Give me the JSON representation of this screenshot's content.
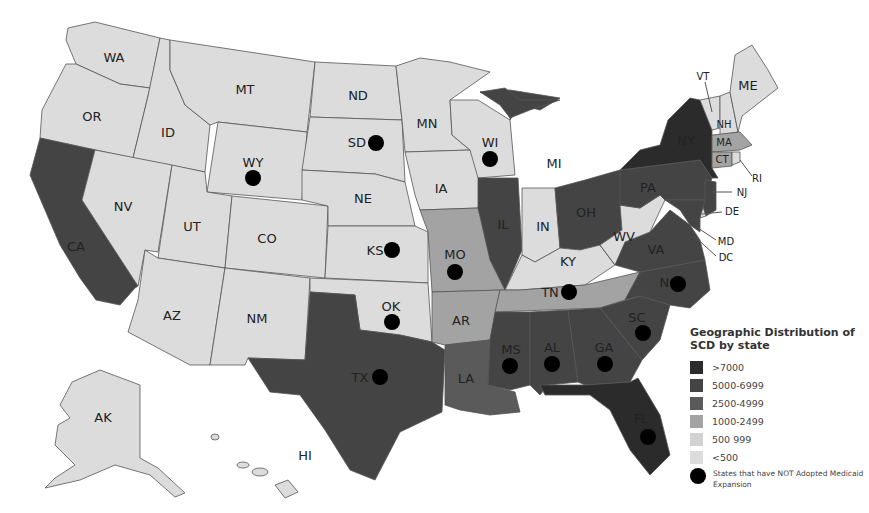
{
  "legend": {
    "title": "Geographic Distribution of SCD by state",
    "bins": [
      {
        "label": ">7000",
        "color": "#2b2b2b"
      },
      {
        "label": "5000-6999",
        "color": "#444444"
      },
      {
        "label": "2500-4999",
        "color": "#5a5a5a"
      },
      {
        "label": "1000-2499",
        "color": "#a3a3a3"
      },
      {
        "label": "500 999",
        "color": "#d2d2d2"
      },
      {
        "label": "<500",
        "color": "#dcdcdc"
      }
    ],
    "marker_label": "States that have NOT Adopted Medicaid Expansion"
  },
  "states": [
    {
      "id": "WA",
      "bin": 5,
      "dot": false
    },
    {
      "id": "OR",
      "bin": 5,
      "dot": false
    },
    {
      "id": "CA",
      "bin": 1,
      "dot": false
    },
    {
      "id": "ID",
      "bin": 5,
      "dot": false
    },
    {
      "id": "NV",
      "bin": 5,
      "dot": false
    },
    {
      "id": "MT",
      "bin": 5,
      "dot": false
    },
    {
      "id": "WY",
      "bin": 5,
      "dot": true
    },
    {
      "id": "UT",
      "bin": 5,
      "dot": false
    },
    {
      "id": "AZ",
      "bin": 5,
      "dot": false
    },
    {
      "id": "CO",
      "bin": 5,
      "dot": false
    },
    {
      "id": "NM",
      "bin": 5,
      "dot": false
    },
    {
      "id": "ND",
      "bin": 5,
      "dot": false
    },
    {
      "id": "SD",
      "bin": 5,
      "dot": true
    },
    {
      "id": "NE",
      "bin": 5,
      "dot": false
    },
    {
      "id": "KS",
      "bin": 5,
      "dot": true
    },
    {
      "id": "OK",
      "bin": 5,
      "dot": true
    },
    {
      "id": "TX",
      "bin": 1,
      "dot": true
    },
    {
      "id": "MN",
      "bin": 5,
      "dot": false
    },
    {
      "id": "IA",
      "bin": 5,
      "dot": false
    },
    {
      "id": "MO",
      "bin": 3,
      "dot": true
    },
    {
      "id": "AR",
      "bin": 3,
      "dot": false
    },
    {
      "id": "LA",
      "bin": 2,
      "dot": false
    },
    {
      "id": "WI",
      "bin": 5,
      "dot": true
    },
    {
      "id": "IL",
      "bin": 1,
      "dot": false
    },
    {
      "id": "MI",
      "bin": 1,
      "dot": false
    },
    {
      "id": "IN",
      "bin": 5,
      "dot": false
    },
    {
      "id": "OH",
      "bin": 1,
      "dot": false
    },
    {
      "id": "KY",
      "bin": 5,
      "dot": false
    },
    {
      "id": "TN",
      "bin": 3,
      "dot": true
    },
    {
      "id": "MS",
      "bin": 1,
      "dot": true
    },
    {
      "id": "AL",
      "bin": 1,
      "dot": true
    },
    {
      "id": "GA",
      "bin": 1,
      "dot": true
    },
    {
      "id": "FL",
      "bin": 0,
      "dot": true
    },
    {
      "id": "SC",
      "bin": 1,
      "dot": true
    },
    {
      "id": "NC",
      "bin": 1,
      "dot": true
    },
    {
      "id": "VA",
      "bin": 1,
      "dot": false
    },
    {
      "id": "WV",
      "bin": 5,
      "dot": false
    },
    {
      "id": "PA",
      "bin": 1,
      "dot": false
    },
    {
      "id": "NY",
      "bin": 0,
      "dot": false
    },
    {
      "id": "NJ",
      "bin": 1,
      "dot": false
    },
    {
      "id": "DE",
      "bin": 5,
      "dot": false
    },
    {
      "id": "MD",
      "bin": 1,
      "dot": false
    },
    {
      "id": "DC",
      "bin": 1,
      "dot": false
    },
    {
      "id": "VT",
      "bin": 5,
      "dot": false
    },
    {
      "id": "NH",
      "bin": 5,
      "dot": false
    },
    {
      "id": "ME",
      "bin": 5,
      "dot": false
    },
    {
      "id": "MA",
      "bin": 3,
      "dot": false
    },
    {
      "id": "CT",
      "bin": 3,
      "dot": false
    },
    {
      "id": "RI",
      "bin": 5,
      "dot": false
    },
    {
      "id": "AK",
      "bin": 5,
      "dot": false
    },
    {
      "id": "HI",
      "bin": 5,
      "dot": false
    }
  ],
  "labels": {
    "WA": "WA",
    "OR": "OR",
    "CA": "CA",
    "ID": "ID",
    "NV": "NV",
    "MT": "MT",
    "WY": "WY",
    "UT": "UT",
    "AZ": "AZ",
    "CO": "CO",
    "NM": "NM",
    "ND": "ND",
    "SD": "SD",
    "NE": "NE",
    "KS": "KS",
    "OK": "OK",
    "TX": "TX",
    "MN": "MN",
    "IA": "IA",
    "MO": "MO",
    "AR": "AR",
    "LA": "LA",
    "WI": "WI",
    "IL": "IL",
    "MI": "MI",
    "IN": "IN",
    "OH": "OH",
    "KY": "KY",
    "TN": "TN",
    "MS": "MS",
    "AL": "AL",
    "GA": "GA",
    "FL": "FL",
    "SC": "SC",
    "NC": "NC",
    "VA": "VA",
    "WV": "WV",
    "PA": "PA",
    "NY": "NY",
    "NJ": "NJ",
    "DE": "DE",
    "MD": "MD",
    "DC": "DC",
    "VT": "VT",
    "NH": "NH",
    "ME": "ME",
    "MA": "MA",
    "CT": "CT",
    "RI": "RI",
    "AK": "AK",
    "HI": "HI"
  }
}
